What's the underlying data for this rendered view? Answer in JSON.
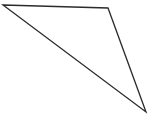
{
  "canvas": {
    "width": 156,
    "height": 125,
    "background_color": "#ffffff",
    "has_border": false
  },
  "figure": {
    "name": "triangle",
    "shape_type": "polygon",
    "closed": true,
    "fill": "none",
    "stroke_color": "#2b2b2b",
    "stroke_width": 1.3,
    "points_attr": "3,5 108,8 146,112",
    "vertices": [
      {
        "label": "left-vertex",
        "x": 3,
        "y": 5
      },
      {
        "label": "top-right-vertex",
        "x": 108,
        "y": 8
      },
      {
        "label": "bottom-right-vertex",
        "x": 146,
        "y": 112
      }
    ],
    "edges": [
      {
        "label": "top-edge",
        "from": "left-vertex",
        "to": "top-right-vertex"
      },
      {
        "label": "right-edge",
        "from": "top-right-vertex",
        "to": "bottom-right-vertex"
      },
      {
        "label": "long-diagonal-edge",
        "from": "bottom-right-vertex",
        "to": "left-vertex"
      }
    ]
  }
}
